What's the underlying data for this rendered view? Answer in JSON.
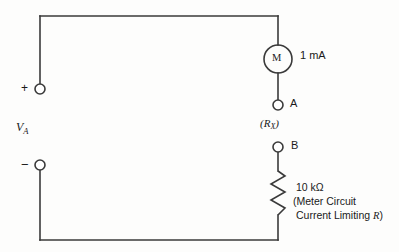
{
  "diagram": {
    "stroke_color": "#3a3a3a",
    "text_color": "#1a1a1a",
    "background_color": "#fdfdfc"
  },
  "source": {
    "label": "V",
    "label_subscript": "A",
    "plus_terminal": "+",
    "minus_terminal": "−"
  },
  "meter": {
    "symbol": "M",
    "rating": "1 mA"
  },
  "terminals": {
    "a": "A",
    "b": "B",
    "unknown_open": "(",
    "unknown_symbol": "R",
    "unknown_subscript": "X",
    "unknown_close": ")",
    "unknown_full": "(R X)"
  },
  "resistor": {
    "value": "10 kΩ",
    "note_line1": "(Meter Circuit",
    "note_line2_prefix": "Current Limiting ",
    "note_line2_italic": "R",
    "note_line2_suffix": ")"
  }
}
